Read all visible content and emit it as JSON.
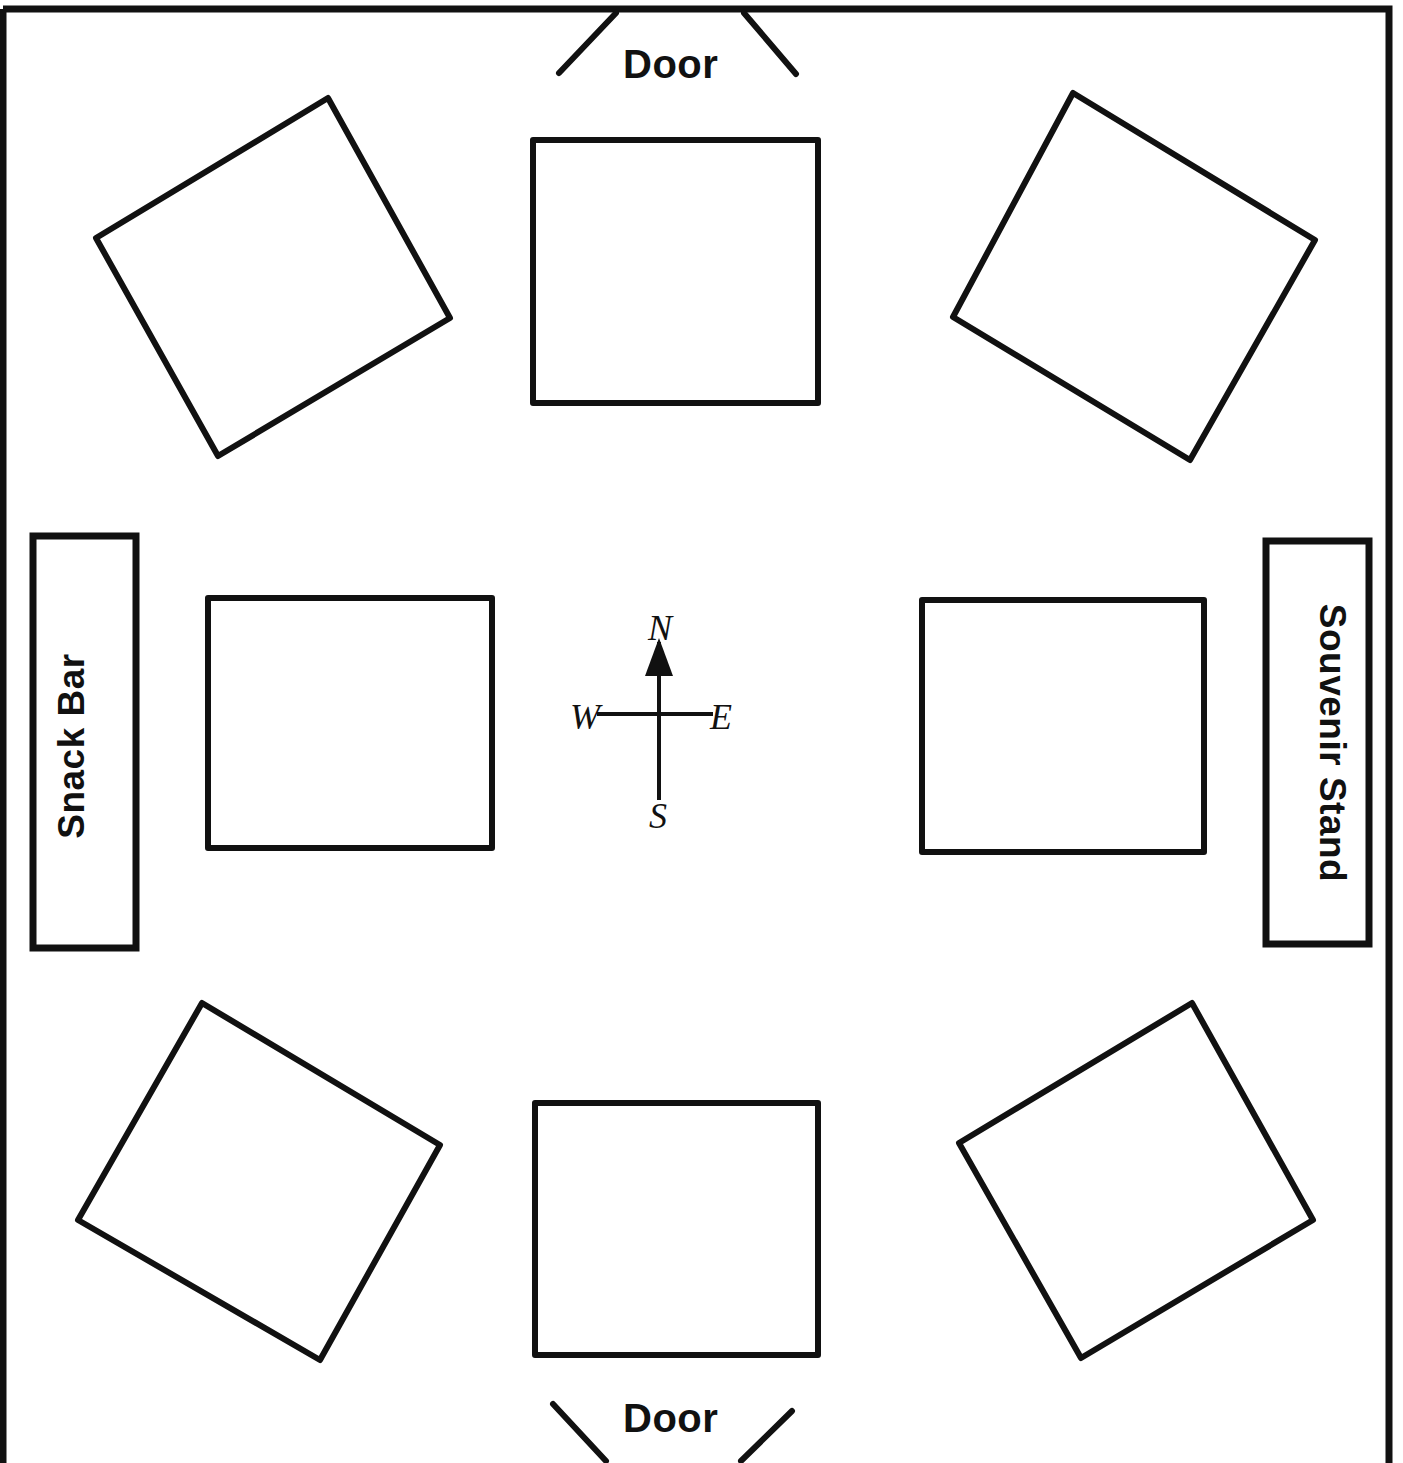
{
  "plan": {
    "title_partial": "Display Hall",
    "background_color": "#ffffff",
    "ink_color": "#111111",
    "canvas": {
      "width": 1403,
      "height": 1463
    }
  },
  "walls": {
    "name": "room-outline",
    "left": 3,
    "top": 9,
    "right": 1389,
    "bottom": 1463,
    "stroke_width": 7
  },
  "doors": [
    {
      "id": "door-north",
      "label": "Door",
      "position": "top-center",
      "label_x": 623,
      "label_y": 42,
      "swing_left": {
        "x1": 616,
        "y1": 13,
        "x2": 559,
        "y2": 73
      },
      "swing_right": {
        "x1": 744,
        "y1": 13,
        "x2": 796,
        "y2": 74
      }
    },
    {
      "id": "door-south",
      "label": "Door",
      "position": "bottom-center",
      "label_x": 623,
      "label_y": 1396,
      "swing_left": {
        "x1": 553,
        "y1": 1404,
        "x2": 606,
        "y2": 1461
      },
      "swing_right": {
        "x1": 792,
        "y1": 1411,
        "x2": 741,
        "y2": 1461
      }
    }
  ],
  "kiosks": [
    {
      "id": "snack-bar",
      "label": "Snack Bar",
      "side": "west",
      "x": 33,
      "y": 536,
      "width": 103,
      "height": 412,
      "text_rotation": -90
    },
    {
      "id": "souvenir-stand",
      "label": "Souvenir Stand",
      "side": "east",
      "x": 1266,
      "y": 541,
      "width": 103,
      "height": 403,
      "text_rotation": 90
    }
  ],
  "tables": [
    {
      "id": "table-nw",
      "position": "northwest",
      "rotation": 22,
      "points": "328,98 450,318 218,456 96,238"
    },
    {
      "id": "table-n",
      "position": "north-center",
      "rotation": 0,
      "points": "533,140 818,140 818,403 533,403"
    },
    {
      "id": "table-ne",
      "position": "northeast",
      "rotation": -22,
      "points": "1073,93 1315,240 1190,460 953,317"
    },
    {
      "id": "table-w",
      "position": "west-center",
      "rotation": 0,
      "points": "208,598 492,598 492,848 208,848"
    },
    {
      "id": "table-e",
      "position": "east-center",
      "rotation": 0,
      "points": "922,600 1204,600 1204,852 922,852"
    },
    {
      "id": "table-sw",
      "position": "southwest",
      "rotation": -22,
      "points": "202,1003 440,1145 320,1360 78,1220"
    },
    {
      "id": "table-s",
      "position": "south-center",
      "rotation": 0,
      "points": "535,1103 818,1103 818,1355 535,1355"
    },
    {
      "id": "table-se",
      "position": "southeast",
      "rotation": 22,
      "points": "1192,1003 1313,1220 1081,1358 959,1143"
    }
  ],
  "compass": {
    "id": "compass-rose",
    "center_x": 659,
    "center_y": 714,
    "north": "N",
    "south": "S",
    "east": "E",
    "west": "W",
    "north_label_x": 648,
    "north_label_y": 607,
    "south_label_x": 649,
    "south_label_y": 795,
    "east_label_x": 710,
    "east_label_y": 696,
    "west_label_x": 570,
    "west_label_y": 696,
    "vline_top": 642,
    "vline_bottom": 800,
    "hline_left": 597,
    "hline_right": 713,
    "arrow": "north-arrow"
  }
}
